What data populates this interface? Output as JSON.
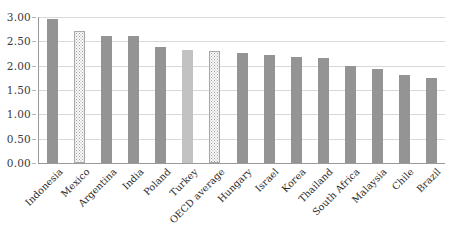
{
  "chart_data": {
    "type": "bar",
    "title": "",
    "subtitle": "",
    "xlabel": "",
    "ylabel": "",
    "ylim": [
      0,
      3.0
    ],
    "ytick_step": 0.5,
    "ytick_labels": [
      "0.00",
      "0.50",
      "1.00",
      "1.50",
      "2.00",
      "2.50",
      "3.00"
    ],
    "ytick_values": [
      0,
      0.5,
      1.0,
      1.5,
      2.0,
      2.5,
      3.0
    ],
    "grid": true,
    "grid_axis": "y",
    "legend": false,
    "legend_position": "none",
    "categories": [
      "Indonesia",
      "Mexico",
      "Argentina",
      "India",
      "Poland",
      "Turkey",
      "OECD average",
      "Hungary",
      "Israel",
      "Korea",
      "Thailand",
      "South Africa",
      "Malaysia",
      "Chile",
      "Brazil"
    ],
    "values": [
      2.95,
      2.71,
      2.62,
      2.62,
      2.39,
      2.33,
      2.3,
      2.27,
      2.21,
      2.17,
      2.16,
      2.0,
      1.94,
      1.8,
      1.74
    ],
    "bar_styles": [
      "solid-dark",
      "dotted",
      "solid-dark",
      "solid-dark",
      "solid-dark",
      "solid-light",
      "dotted",
      "solid-dark",
      "solid-dark",
      "solid-dark",
      "solid-dark",
      "solid-dark",
      "solid-dark",
      "solid-dark",
      "solid-dark"
    ],
    "xtick_rotation": -45
  },
  "colors": {
    "bar_solid_dark": "#949494",
    "bar_solid_light": "#c2c2c2",
    "bar_dotted_fill": "#fbfbfb",
    "bar_dotted_border": "#a8a8a8",
    "gridline": "#d9d9d9",
    "axis_line": "#9a9a9a",
    "text": "#2b2b2b",
    "background": "#ffffff"
  }
}
